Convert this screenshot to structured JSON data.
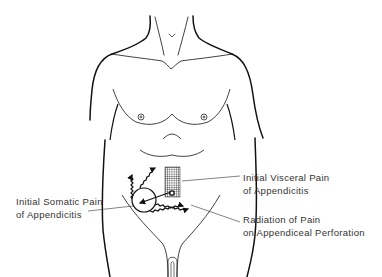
{
  "figure": {
    "labels": {
      "visceral": {
        "line1": "Initial Visceral Pain",
        "line2": "of Appendicitis"
      },
      "somatic": {
        "line1": "Initial Somatic Pain",
        "line2": "of Appendicitis"
      },
      "radiation": {
        "line1": "Radiation of Pain",
        "line2": "on Appendiceal Perforation"
      }
    },
    "colors": {
      "ink": "#111111",
      "label_text": "#333333",
      "background": "#ffffff"
    }
  }
}
